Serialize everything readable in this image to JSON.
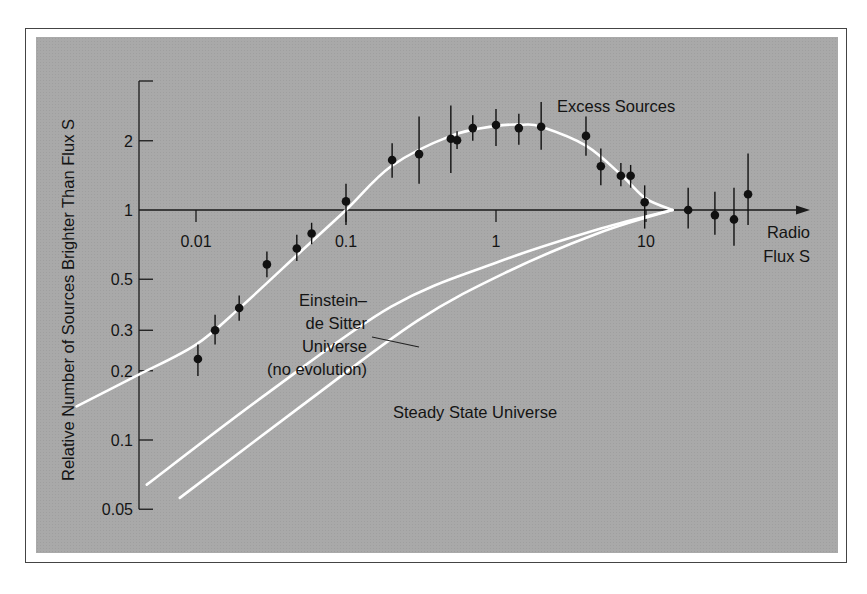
{
  "chart_data": {
    "type": "scatter",
    "title": "",
    "xlabel": "Radio Flux S",
    "xlabel_lines": [
      "Radio",
      "Flux S"
    ],
    "ylabel": "Relative Number of Sources Brighter Than Flux S",
    "x_scale": "log",
    "y_scale": "log",
    "xlim": [
      0.0015,
      60
    ],
    "ylim": [
      0.05,
      3.0
    ],
    "x_ticks": [
      {
        "value": 0.01,
        "label": "0.01"
      },
      {
        "value": 0.1,
        "label": "0.1"
      },
      {
        "value": 1,
        "label": "1"
      },
      {
        "value": 10,
        "label": "10"
      }
    ],
    "y_ticks": [
      {
        "value": 2,
        "label": "2"
      },
      {
        "value": 1,
        "label": "1"
      },
      {
        "value": 0.5,
        "label": "0.5"
      },
      {
        "value": 0.3,
        "label": "0.3"
      },
      {
        "value": 0.2,
        "label": "0.2"
      },
      {
        "value": 0.1,
        "label": "0.1"
      },
      {
        "value": 0.05,
        "label": "0.05"
      }
    ],
    "grid": false,
    "legend": null,
    "series": [
      {
        "name": "Observed source counts",
        "kind": "points_with_error_bars",
        "points": [
          {
            "x": 0.0103,
            "y": 0.225,
            "y_lo": 0.19,
            "y_hi": 0.26
          },
          {
            "x": 0.0134,
            "y": 0.3,
            "y_lo": 0.26,
            "y_hi": 0.35
          },
          {
            "x": 0.0194,
            "y": 0.375,
            "y_lo": 0.33,
            "y_hi": 0.425
          },
          {
            "x": 0.0297,
            "y": 0.58,
            "y_lo": 0.51,
            "y_hi": 0.66
          },
          {
            "x": 0.047,
            "y": 0.68,
            "y_lo": 0.6,
            "y_hi": 0.78
          },
          {
            "x": 0.059,
            "y": 0.79,
            "y_lo": 0.71,
            "y_hi": 0.88
          },
          {
            "x": 0.1,
            "y": 1.09,
            "y_lo": 0.86,
            "y_hi": 1.3
          },
          {
            "x": 0.203,
            "y": 1.65,
            "y_lo": 1.38,
            "y_hi": 1.95
          },
          {
            "x": 0.307,
            "y": 1.75,
            "y_lo": 1.3,
            "y_hi": 2.55
          },
          {
            "x": 0.5,
            "y": 2.04,
            "y_lo": 1.45,
            "y_hi": 2.85
          },
          {
            "x": 0.55,
            "y": 2.01,
            "y_lo": 1.84,
            "y_hi": 2.2
          },
          {
            "x": 0.7,
            "y": 2.27,
            "y_lo": 2.0,
            "y_hi": 2.58
          },
          {
            "x": 1.0,
            "y": 2.34,
            "y_lo": 1.9,
            "y_hi": 2.75
          },
          {
            "x": 1.42,
            "y": 2.27,
            "y_lo": 1.92,
            "y_hi": 2.62
          },
          {
            "x": 2.0,
            "y": 2.3,
            "y_lo": 1.83,
            "y_hi": 2.95
          },
          {
            "x": 3.98,
            "y": 2.1,
            "y_lo": 1.72,
            "y_hi": 2.55
          },
          {
            "x": 5.0,
            "y": 1.55,
            "y_lo": 1.28,
            "y_hi": 1.85
          },
          {
            "x": 6.8,
            "y": 1.41,
            "y_lo": 1.27,
            "y_hi": 1.6
          },
          {
            "x": 7.9,
            "y": 1.41,
            "y_lo": 1.25,
            "y_hi": 1.57
          },
          {
            "x": 9.8,
            "y": 1.08,
            "y_lo": 0.83,
            "y_hi": 1.28
          },
          {
            "x": 19.1,
            "y": 1.0,
            "y_lo": 0.83,
            "y_hi": 1.25
          },
          {
            "x": 28.8,
            "y": 0.95,
            "y_lo": 0.78,
            "y_hi": 1.2
          },
          {
            "x": 38.6,
            "y": 0.91,
            "y_lo": 0.7,
            "y_hi": 1.25
          },
          {
            "x": 47.9,
            "y": 1.17,
            "y_lo": 0.86,
            "y_hi": 1.76
          }
        ]
      },
      {
        "name": "Evolution fit (Excess Sources)",
        "kind": "curve",
        "points": [
          {
            "x": 0.0016,
            "y": 0.14
          },
          {
            "x": 0.004,
            "y": 0.19
          },
          {
            "x": 0.01,
            "y": 0.26
          },
          {
            "x": 0.02,
            "y": 0.38
          },
          {
            "x": 0.05,
            "y": 0.66
          },
          {
            "x": 0.1,
            "y": 1.0
          },
          {
            "x": 0.2,
            "y": 1.55
          },
          {
            "x": 0.5,
            "y": 2.1
          },
          {
            "x": 1.0,
            "y": 2.32
          },
          {
            "x": 1.5,
            "y": 2.35
          },
          {
            "x": 2.0,
            "y": 2.3
          },
          {
            "x": 4.0,
            "y": 1.9
          },
          {
            "x": 7.0,
            "y": 1.4
          },
          {
            "x": 10.0,
            "y": 1.12
          },
          {
            "x": 15.0,
            "y": 1.0
          }
        ]
      },
      {
        "name": "Einstein–de Sitter Universe (no evolution)",
        "kind": "curve",
        "points": [
          {
            "x": 0.0047,
            "y": 0.064
          },
          {
            "x": 0.03,
            "y": 0.16
          },
          {
            "x": 0.2,
            "y": 0.38
          },
          {
            "x": 1.0,
            "y": 0.59
          },
          {
            "x": 5.0,
            "y": 0.83
          },
          {
            "x": 15.0,
            "y": 1.0
          }
        ]
      },
      {
        "name": "Steady State Universe",
        "kind": "curve",
        "points": [
          {
            "x": 0.0078,
            "y": 0.056
          },
          {
            "x": 0.05,
            "y": 0.14
          },
          {
            "x": 0.3,
            "y": 0.33
          },
          {
            "x": 1.2,
            "y": 0.54
          },
          {
            "x": 5.0,
            "y": 0.8
          },
          {
            "x": 15.0,
            "y": 1.0
          }
        ]
      }
    ],
    "annotations": [
      {
        "text": "Excess Sources",
        "x": 2.6,
        "y": 2.7
      },
      {
        "text_lines": [
          "Einstein–",
          "de Sitter",
          "Universe",
          "(no evolution)"
        ],
        "x": 0.12,
        "y": 0.3,
        "leader_to": {
          "x": 0.24,
          "y": 0.36
        }
      },
      {
        "text": "Steady State Universe",
        "x": 0.2,
        "y": 0.135
      }
    ]
  },
  "labels": {
    "excess": "Excess Sources",
    "eds_lines": [
      "Einstein–",
      "de Sitter",
      "Universe",
      "(no evolution)"
    ],
    "steady": "Steady State Universe",
    "x_title_lines": [
      "Radio",
      "Flux S"
    ],
    "y_title": "Relative Number of Sources Brighter Than Flux S"
  },
  "colors": {
    "panel": "#a9a9a9",
    "curve": "#ffffff",
    "ink": "#111111"
  }
}
